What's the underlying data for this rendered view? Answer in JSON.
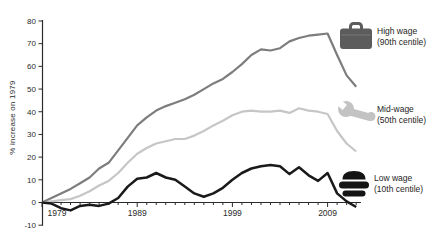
{
  "chart_data": {
    "type": "line",
    "title": "",
    "ylabel": "% increase on 1979",
    "xlabel": "",
    "ylim": [
      -10,
      80
    ],
    "yticks": [
      80,
      70,
      60,
      50,
      40,
      30,
      20,
      10,
      0,
      -10
    ],
    "xticks_labeled": [
      1979,
      1989,
      1999,
      2009
    ],
    "grid": false,
    "legend_position": "right",
    "x": [
      1979,
      1980,
      1981,
      1982,
      1983,
      1984,
      1985,
      1986,
      1987,
      1988,
      1989,
      1990,
      1991,
      1992,
      1993,
      1994,
      1995,
      1996,
      1997,
      1998,
      1999,
      2000,
      2001,
      2002,
      2003,
      2004,
      2005,
      2006,
      2007,
      2008,
      2009,
      2010,
      2011,
      2012
    ],
    "series": [
      {
        "id": "high-wage",
        "name": "High wage (90th centile)",
        "color": "#7d7d7d",
        "width": 2.2,
        "values": [
          0,
          2,
          4,
          6,
          8.5,
          11,
          15,
          17.5,
          23,
          28.5,
          34,
          37.5,
          40.5,
          42.5,
          44,
          45.5,
          47.5,
          50,
          52.5,
          54.5,
          57.5,
          61,
          65,
          67.5,
          67,
          68,
          71,
          72.5,
          73.5,
          74,
          74.5,
          65,
          56,
          51
        ]
      },
      {
        "id": "mid-wage",
        "name": "Mid-wage (50th centile)",
        "color": "#c6c6c6",
        "width": 2.2,
        "values": [
          0,
          0.5,
          1,
          1.5,
          3,
          5,
          7.5,
          9.5,
          13,
          17.5,
          21.5,
          24,
          26,
          27,
          28,
          28,
          29.5,
          31.5,
          34,
          36,
          38.5,
          40,
          40.5,
          40,
          40,
          40.5,
          39.5,
          41.5,
          40.5,
          40,
          39,
          31.5,
          26,
          22.5
        ]
      },
      {
        "id": "low-wage",
        "name": "Low wage (10th centile)",
        "color": "#1a1a1a",
        "width": 2.5,
        "values": [
          0,
          -0.5,
          -2.5,
          -3.5,
          -1.5,
          -1,
          -1.5,
          -0.5,
          2,
          7,
          10.5,
          11,
          13,
          11,
          10,
          7,
          4,
          2.5,
          4,
          6.5,
          10,
          13,
          15,
          16,
          16.5,
          16,
          12.5,
          15.5,
          12,
          9.5,
          13,
          4,
          0.5,
          -2
        ]
      }
    ]
  },
  "legend": {
    "high": {
      "icon": "briefcase-icon",
      "line1": "High wage",
      "line2": "(90th centile)"
    },
    "mid": {
      "icon": "wrench-icon",
      "line1": "Mid-wage",
      "line2": "(50th centile)"
    },
    "low": {
      "icon": "burger-icon",
      "line1": "Low wage",
      "line2": "(10th centile)"
    }
  },
  "colors": {
    "background": "#ffffff",
    "axis": "#2b2b2b",
    "high_wage_line": "#7d7d7d",
    "mid_wage_line": "#c6c6c6",
    "low_wage_line": "#1a1a1a",
    "briefcase_icon": "#5c5c5c",
    "wrench_icon": "#c3c3c3",
    "burger_icon": "#141414"
  }
}
